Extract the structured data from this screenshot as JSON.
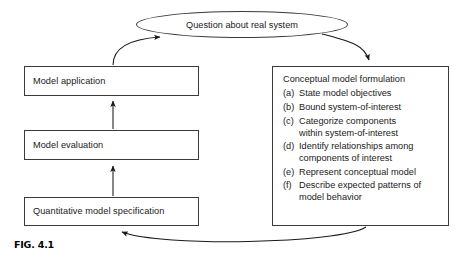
{
  "figure": {
    "caption": "FIG. 4.1",
    "colors": {
      "stroke": "#3a3a3a",
      "text": "#1a1a1a",
      "background": "#ffffff"
    }
  },
  "nodes": {
    "question_ellipse": {
      "label": "Question about real system"
    },
    "model_application": {
      "label": "Model application"
    },
    "model_evaluation": {
      "label": "Model evaluation"
    },
    "quantitative_model_specification": {
      "label": "Quantitative model specification"
    }
  },
  "panel": {
    "heading": "Conceptual model formulation",
    "items": [
      {
        "marker": "(a)",
        "text": "State model objectives",
        "continuation": ""
      },
      {
        "marker": "(b)",
        "text": "Bound system-of-interest",
        "continuation": ""
      },
      {
        "marker": "(c)",
        "text": "Categorize components",
        "continuation": "within system-of-interest"
      },
      {
        "marker": "(d)",
        "text": "Identify relationships among",
        "continuation": "components of interest"
      },
      {
        "marker": "(e)",
        "text": "Represent conceptual model",
        "continuation": ""
      },
      {
        "marker": "(f)",
        "text": "Describe expected patterns of",
        "continuation": "model behavior"
      }
    ]
  },
  "connectors": [
    {
      "name": "model-application-to-question",
      "from": "model_application",
      "to": "question_ellipse"
    },
    {
      "name": "question-to-conceptual-panel",
      "from": "question_ellipse",
      "to": "panel"
    },
    {
      "name": "conceptual-panel-to-quantitative-spec",
      "from": "panel",
      "to": "quantitative_model_specification"
    },
    {
      "name": "quantitative-spec-to-model-evaluation",
      "from": "quantitative_model_specification",
      "to": "model_evaluation"
    },
    {
      "name": "model-evaluation-to-model-application",
      "from": "model_evaluation",
      "to": "model_application"
    }
  ]
}
